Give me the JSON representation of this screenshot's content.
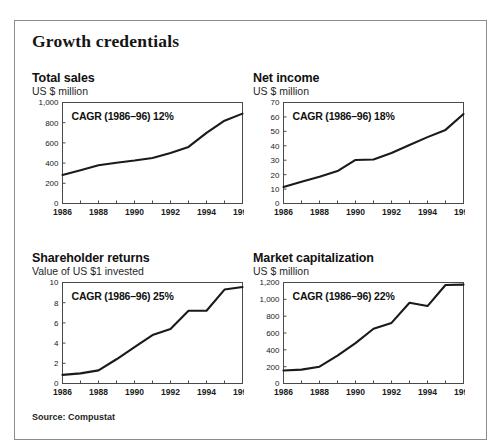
{
  "figure": {
    "title": "Growth credentials",
    "source": "Source: Compustat",
    "border_color": "#8c8c90",
    "line_color": "#1a1a1a"
  },
  "chart_data": [
    {
      "id": "total-sales",
      "type": "line",
      "title": "Total sales",
      "subtitle": "US $ million",
      "ylabel": "US $ million",
      "xlabel": "",
      "annotation": "CAGR (1986–96) 12%",
      "grid": false,
      "legend": "none",
      "xlim": [
        1986,
        1996
      ],
      "ylim": [
        0,
        1000
      ],
      "yticks": [
        0,
        200,
        400,
        600,
        800,
        1000
      ],
      "ytick_labels": [
        "0",
        "200",
        "400",
        "600",
        "800",
        "1,000"
      ],
      "xticks": [
        1986,
        1988,
        1990,
        1992,
        1994,
        1996
      ],
      "xtick_labels": [
        "1986",
        "1988",
        "1990",
        "1992",
        "1994",
        "1996"
      ],
      "x": [
        1986,
        1987,
        1988,
        1989,
        1990,
        1991,
        1992,
        1993,
        1994,
        1995,
        1996
      ],
      "values": [
        283,
        330,
        378,
        404,
        425,
        450,
        500,
        560,
        700,
        820,
        890
      ]
    },
    {
      "id": "net-income",
      "type": "line",
      "title": "Net income",
      "subtitle": "US $ million",
      "ylabel": "US $ million",
      "xlabel": "",
      "annotation": "CAGR (1986–96) 18%",
      "grid": false,
      "legend": "none",
      "xlim": [
        1986,
        1996
      ],
      "ylim": [
        0,
        70
      ],
      "yticks": [
        0,
        10,
        20,
        30,
        40,
        50,
        60,
        70
      ],
      "ytick_labels": [
        "0",
        "10",
        "20",
        "30",
        "40",
        "50",
        "60",
        "70"
      ],
      "xticks": [
        1986,
        1988,
        1990,
        1992,
        1994,
        1996
      ],
      "xtick_labels": [
        "1986",
        "1988",
        "1990",
        "1992",
        "1994",
        "1996"
      ],
      "x": [
        1986,
        1987,
        1988,
        1989,
        1990,
        1991,
        1992,
        1993,
        1994,
        1995,
        1996
      ],
      "values": [
        11.5,
        15,
        18.5,
        22.5,
        30.2,
        30.5,
        35,
        40.5,
        46,
        51,
        62
      ]
    },
    {
      "id": "shareholder-returns",
      "type": "line",
      "title": "Shareholder returns",
      "subtitle": "Value of US $1 invested",
      "ylabel": "Value of US $1 invested",
      "xlabel": "",
      "annotation": "CAGR (1986–96) 25%",
      "grid": false,
      "legend": "none",
      "xlim": [
        1986,
        1996
      ],
      "ylim": [
        0,
        10
      ],
      "yticks": [
        0,
        2,
        4,
        6,
        8,
        10
      ],
      "ytick_labels": [
        "0",
        "2",
        "4",
        "6",
        "8",
        "10"
      ],
      "xticks": [
        1986,
        1988,
        1990,
        1992,
        1994,
        1996
      ],
      "xtick_labels": [
        "1986",
        "1988",
        "1990",
        "1992",
        "1994",
        "1996"
      ],
      "x": [
        1986,
        1987,
        1988,
        1989,
        1990,
        1991,
        1992,
        1993,
        1994,
        1995,
        1996
      ],
      "values": [
        0.85,
        1.0,
        1.3,
        2.4,
        3.6,
        4.8,
        5.4,
        7.2,
        7.2,
        9.3,
        9.55
      ]
    },
    {
      "id": "market-capitalization",
      "type": "line",
      "title": "Market capitalization",
      "subtitle": "US $ million",
      "ylabel": "US $ million",
      "xlabel": "",
      "annotation": "CAGR (1986–96) 22%",
      "grid": false,
      "legend": "none",
      "xlim": [
        1986,
        1996
      ],
      "ylim": [
        0,
        1200
      ],
      "yticks": [
        0,
        200,
        400,
        600,
        800,
        1000,
        1200
      ],
      "ytick_labels": [
        "0",
        "200",
        "400",
        "600",
        "800",
        "1,000",
        "1,200"
      ],
      "xticks": [
        1986,
        1988,
        1990,
        1992,
        1994,
        1996
      ],
      "xtick_labels": [
        "1986",
        "1988",
        "1990",
        "1992",
        "1994",
        "1996"
      ],
      "x": [
        1986,
        1987,
        1988,
        1989,
        1990,
        1991,
        1992,
        1993,
        1994,
        1995,
        1996
      ],
      "values": [
        155,
        165,
        200,
        330,
        480,
        650,
        720,
        960,
        920,
        1170,
        1175
      ]
    }
  ]
}
